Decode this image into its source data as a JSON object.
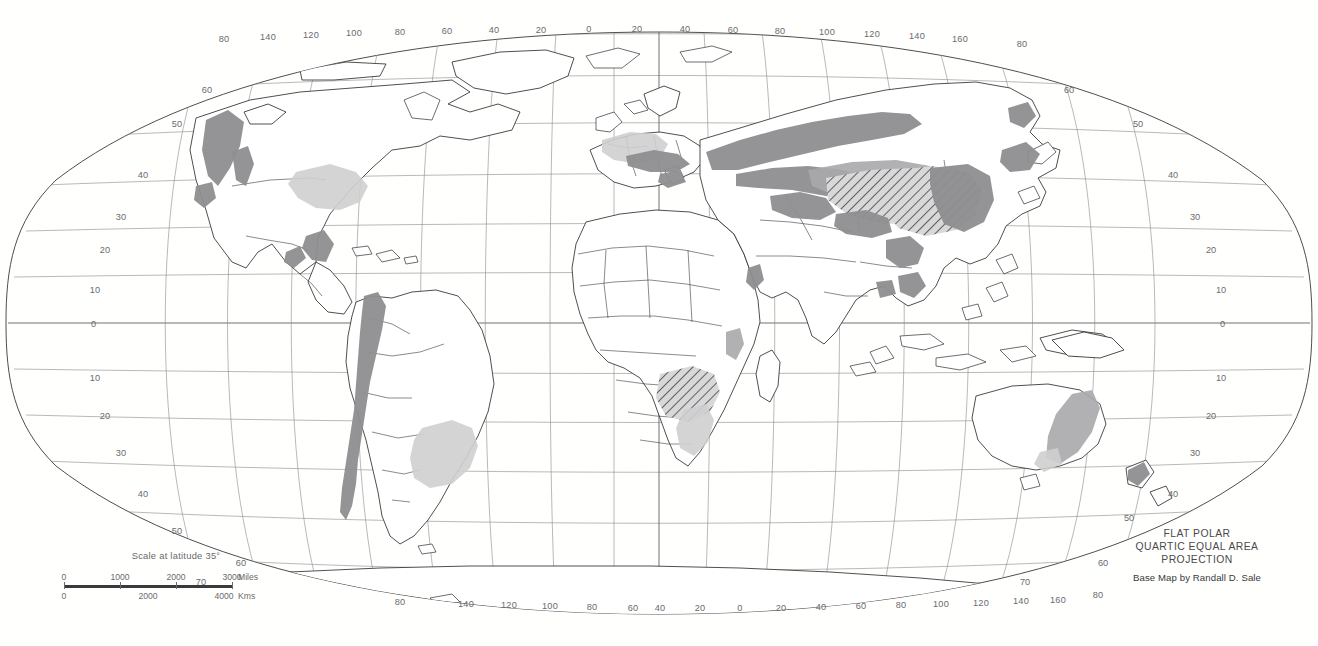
{
  "map": {
    "projection_lines": [
      "FLAT POLAR",
      "QUARTIC EQUAL AREA",
      "PROJECTION"
    ],
    "credit": "Base Map by Randall D. Sale",
    "scale": {
      "title": "Scale at latitude 35°",
      "miles_label": "Miles",
      "kms_label": "Kms",
      "miles_ticks": [
        "0",
        "1000",
        "2000",
        "3000"
      ],
      "kms_ticks": [
        "0",
        "2000",
        "4000"
      ]
    },
    "graticule": {
      "longitude_labels_top": [
        "140",
        "120",
        "100",
        "80",
        "60",
        "40",
        "20",
        "0",
        "20",
        "40",
        "60",
        "80",
        "100",
        "120",
        "140",
        "160"
      ],
      "longitude_labels_bottom": [
        "140",
        "120",
        "100",
        "80",
        "60",
        "40",
        "20",
        "0",
        "20",
        "40",
        "60",
        "80",
        "100",
        "120",
        "140",
        "160"
      ],
      "latitude_labels_left": [
        "50",
        "40",
        "30",
        "20",
        "10",
        "0",
        "10",
        "20",
        "30",
        "40",
        "50"
      ],
      "latitude_labels_right": [
        "60",
        "50",
        "40",
        "30",
        "20",
        "10",
        "0",
        "10",
        "20",
        "30",
        "40",
        "50"
      ],
      "pole_label_top_left": "80",
      "pole_label_top_right": "80",
      "pole_label_bottom_left": "80",
      "pole_label_bottom_right": "80",
      "spacing_degrees": 20,
      "equator_degree": 0
    },
    "colors": {
      "background": "#ffffff",
      "land_fill": "#ffffff",
      "coastline": "#2f2f31",
      "graticule": "#8d8d90",
      "shade_dark": "#8e8e90",
      "shade_mid": "#a9a9ab",
      "shade_light": "#cfcfd0",
      "label_text": "#6a6a6d"
    }
  }
}
